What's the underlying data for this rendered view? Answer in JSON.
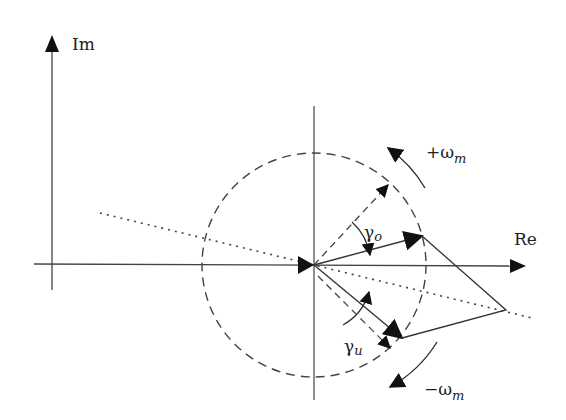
{
  "diagram": {
    "type": "phasor-diagram",
    "axes": {
      "imag_label": "Im",
      "real_label": "Re"
    },
    "labels": {
      "gamma_o": "γ",
      "gamma_o_sub": "o",
      "gamma_u": "γ",
      "gamma_u_sub": "u",
      "plus_omega": "+ω",
      "plus_omega_sub": "m",
      "minus_omega": "−ω",
      "minus_omega_sub": "m"
    },
    "colors": {
      "line": "#333333",
      "fill": "#111111",
      "background": "#ffffff"
    }
  }
}
